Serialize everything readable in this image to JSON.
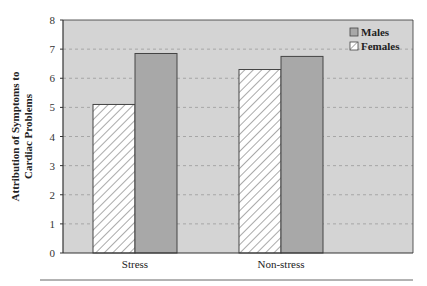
{
  "chart_data": {
    "type": "bar",
    "title": "",
    "xlabel": "",
    "ylabel": "Attribution of Symptoms to Cardiac Problems",
    "ylabel_lines": [
      "Attribution of Symptoms to",
      "Cardiac Problems"
    ],
    "categories": [
      "Stress",
      "Non-stress"
    ],
    "series": [
      {
        "name": "Females",
        "values": [
          5.1,
          6.3
        ],
        "fill": "hatch",
        "color": "#ffffff"
      },
      {
        "name": "Males",
        "values": [
          6.85,
          6.75
        ],
        "fill": "solid",
        "color": "#a8a8a8"
      }
    ],
    "ylim": [
      0,
      8
    ],
    "yticks": [
      0,
      1,
      2,
      3,
      4,
      5,
      6,
      7,
      8
    ],
    "grid": true,
    "grid_style": "dashed",
    "legend": {
      "position": "upper-right",
      "entries": [
        "Males",
        "Females"
      ]
    },
    "plot_background": "#d4d4d4"
  }
}
